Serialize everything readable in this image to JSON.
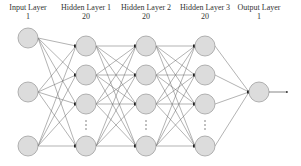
{
  "diagram": {
    "layers": [
      {
        "name": "Input Layer",
        "count": "1",
        "x": 28,
        "nodes": [
          38,
          92,
          146
        ],
        "ellipsis": false
      },
      {
        "name": "Hidden Layer 1",
        "count": "20",
        "x": 86,
        "nodes": [
          46,
          75,
          104,
          146
        ],
        "ellipsis": true
      },
      {
        "name": "Hidden Layer 2",
        "count": "20",
        "x": 146,
        "nodes": [
          46,
          75,
          104,
          146
        ],
        "ellipsis": true
      },
      {
        "name": "Hidden Layer 3",
        "count": "20",
        "x": 205,
        "nodes": [
          46,
          75,
          104,
          146
        ],
        "ellipsis": true
      },
      {
        "name": "Output Layer",
        "count": "1",
        "x": 259,
        "nodes": [
          92
        ],
        "ellipsis": false
      }
    ],
    "colors": {
      "node_fill": "#dcdcdc",
      "node_stroke": "#a0a0a0",
      "edge": "#666666",
      "text": "#333333"
    }
  }
}
